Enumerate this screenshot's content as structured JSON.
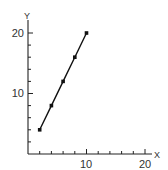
{
  "chart_data": {
    "type": "line",
    "title": "",
    "xlabel": "X",
    "ylabel": "Y",
    "x": [
      2,
      4,
      6,
      8,
      10
    ],
    "series": [
      {
        "name": "y",
        "values": [
          4,
          8,
          12,
          16,
          20
        ],
        "markers": true
      }
    ],
    "xlim": [
      0,
      20
    ],
    "ylim": [
      0,
      20
    ],
    "x_major_ticks": [
      10,
      20
    ],
    "y_major_ticks": [
      10,
      20
    ],
    "x_minor_tick_step": 2,
    "y_minor_tick_step": 2,
    "grid": false,
    "legend": null
  },
  "labels": {
    "y_axis": "Y",
    "x_axis": "X",
    "y_tick_10": "10",
    "y_tick_20": "20",
    "x_tick_10": "10",
    "x_tick_20": "20"
  }
}
